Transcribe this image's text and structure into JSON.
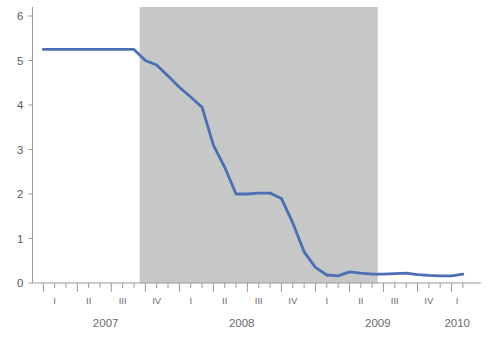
{
  "chart_data": {
    "type": "line",
    "title": "",
    "subtitle": "",
    "xlabel": "",
    "ylabel": "",
    "ylim": [
      0,
      6
    ],
    "yticks": [
      0,
      1,
      2,
      3,
      4,
      5,
      6
    ],
    "ytick_labels": [
      "0",
      "1",
      "2",
      "3",
      "4",
      "5",
      "6"
    ],
    "grid": false,
    "legend": null,
    "legend_position": "none",
    "line_color": "#4a6fb5",
    "shaded_band_color": "#c6c7c7",
    "axis_color": "#9a9a9c",
    "x_axis_type": "monthly",
    "x_start": "2007-01",
    "x_end": "2010-02",
    "quarter_labels": [
      "I",
      "II",
      "III",
      "IV",
      "I",
      "II",
      "III",
      "IV",
      "I",
      "II",
      "III",
      "IV",
      "I"
    ],
    "year_labels": [
      "2007",
      "2008",
      "2009",
      "2010"
    ],
    "shaded_regions": [
      {
        "label": "recession",
        "start": "2007-10",
        "end": "2009-06",
        "color": "#c6c7c7"
      }
    ],
    "x": [
      "2007-01",
      "2007-02",
      "2007-03",
      "2007-04",
      "2007-05",
      "2007-06",
      "2007-07",
      "2007-08",
      "2007-09",
      "2007-10",
      "2007-11",
      "2007-12",
      "2008-01",
      "2008-02",
      "2008-03",
      "2008-04",
      "2008-05",
      "2008-06",
      "2008-07",
      "2008-08",
      "2008-09",
      "2008-10",
      "2008-11",
      "2008-12",
      "2009-01",
      "2009-02",
      "2009-03",
      "2009-04",
      "2009-05",
      "2009-06",
      "2009-07",
      "2009-08",
      "2009-09",
      "2009-10",
      "2009-11",
      "2009-12",
      "2010-01",
      "2010-02"
    ],
    "values": [
      5.25,
      5.25,
      5.25,
      5.25,
      5.25,
      5.25,
      5.25,
      5.25,
      5.25,
      5.0,
      4.9,
      4.65,
      4.4,
      4.18,
      3.95,
      3.1,
      2.6,
      2.0,
      2.0,
      2.02,
      2.02,
      1.9,
      1.35,
      0.7,
      0.35,
      0.18,
      0.16,
      0.25,
      0.22,
      0.2,
      0.2,
      0.21,
      0.22,
      0.19,
      0.17,
      0.16,
      0.16,
      0.2
    ],
    "series": [
      {
        "name": "series-1",
        "color": "#4a6fb5"
      }
    ]
  }
}
